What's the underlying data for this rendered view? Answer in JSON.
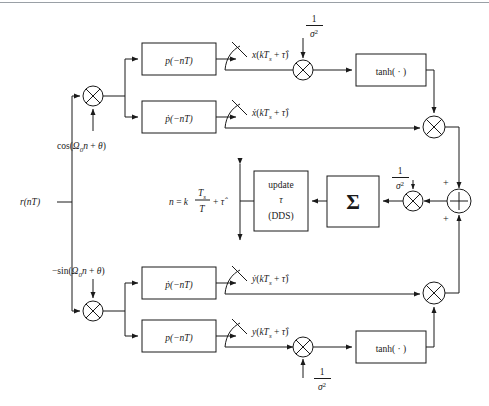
{
  "diagram": {
    "colors": {
      "line": "#1a1a1a",
      "background": "#ffffff",
      "rule": "#9aa0a6"
    },
    "input": {
      "label": "r(nT)"
    },
    "carriers": {
      "inphase": "cos(Ω0n + θ)",
      "inphase_parts": {
        "pre": "cos(",
        "omega": "Ω",
        "sub": "0",
        "mid": "n + ",
        "theta": "θ",
        "post": ")"
      },
      "quadrature": "−sin(Ω0n + θ)",
      "quadrature_parts": {
        "pre": "−sin(",
        "omega": "Ω",
        "sub": "0",
        "mid": "n + ",
        "theta": "θ",
        "post": ")"
      }
    },
    "filters": {
      "top_matched": "p(−nT)",
      "top_derivative": "ṗ(−nT)",
      "bottom_derivative": "ṗ(−nT)",
      "bottom_matched": "p(−nT)"
    },
    "signals": {
      "x": "x(kTs + τ̂)",
      "x_dot": "ẋ(kTs + τ̂)",
      "y_dot": "ẏ(kTs + τ̂)",
      "y": "y(kTs + τ̂)"
    },
    "gains": {
      "numerator": "1",
      "denominator": "σ",
      "exponent": "2",
      "label": "1/σ²",
      "count": 4
    },
    "nonlinearity": {
      "label": "tanh( · )",
      "count": 2
    },
    "summation": {
      "glyph": "Σ",
      "name": "error-summer"
    },
    "adder": {
      "glyph": "+",
      "sign_top": "+",
      "sign_bottom": "+"
    },
    "multiplier": {
      "glyph": "⊗"
    },
    "update_block": {
      "line1": "update",
      "line2": "τ",
      "line3": "(DDS)"
    },
    "index_equation": {
      "lhs": "n = k",
      "frac_num": "Ts",
      "frac_den": "T",
      "rhs": "+ τ̂"
    },
    "sampler": {
      "name": "downsampler-switch",
      "count": 4
    }
  }
}
